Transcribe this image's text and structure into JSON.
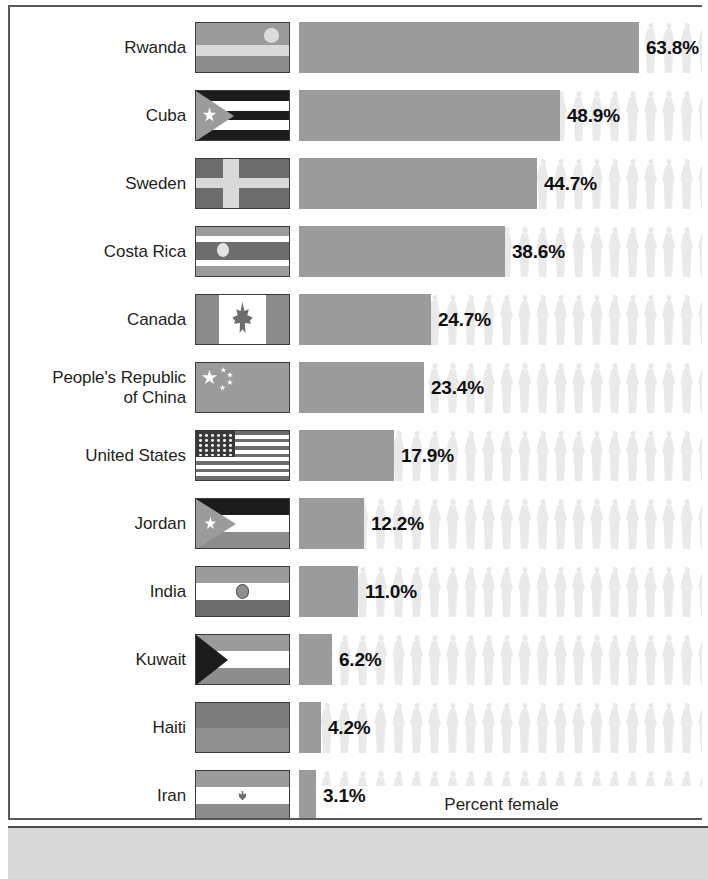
{
  "chart_data": {
    "type": "bar",
    "title": "",
    "xlabel": "Percent female",
    "ylabel": "",
    "orientation": "horizontal",
    "grid": false,
    "legend": null,
    "xlim": [
      0,
      76
    ],
    "unit": "%",
    "categories": [
      "Rwanda",
      "Cuba",
      "Sweden",
      "Costa Rica",
      "Canada",
      "People's Republic of China",
      "United States",
      "Jordan",
      "India",
      "Kuwait",
      "Haiti",
      "Iran"
    ],
    "values": [
      63.8,
      48.9,
      44.7,
      38.6,
      24.7,
      23.4,
      17.9,
      12.2,
      11.0,
      6.2,
      4.2,
      3.1
    ],
    "value_labels": [
      "63.8%",
      "48.9%",
      "44.7%",
      "38.6%",
      "24.7%",
      "23.4%",
      "17.9%",
      "12.2%",
      "11.0%",
      "6.2%",
      "4.2%",
      "3.1%"
    ]
  },
  "axis": {
    "x_title": "Percent female"
  },
  "rows": [
    {
      "country": "Rwanda",
      "country_line1": "Rwanda",
      "country_line2": "",
      "value": 63.8,
      "value_label": "63.8%",
      "flag_name": "flag-rwanda"
    },
    {
      "country": "Cuba",
      "country_line1": "Cuba",
      "country_line2": "",
      "value": 48.9,
      "value_label": "48.9%",
      "flag_name": "flag-cuba"
    },
    {
      "country": "Sweden",
      "country_line1": "Sweden",
      "country_line2": "",
      "value": 44.7,
      "value_label": "44.7%",
      "flag_name": "flag-sweden"
    },
    {
      "country": "Costa Rica",
      "country_line1": "Costa Rica",
      "country_line2": "",
      "value": 38.6,
      "value_label": "38.6%",
      "flag_name": "flag-costa-rica"
    },
    {
      "country": "Canada",
      "country_line1": "Canada",
      "country_line2": "",
      "value": 24.7,
      "value_label": "24.7%",
      "flag_name": "flag-canada"
    },
    {
      "country": "People's Republic of China",
      "country_line1": "People's Republic",
      "country_line2": "of China",
      "value": 23.4,
      "value_label": "23.4%",
      "flag_name": "flag-china"
    },
    {
      "country": "United States",
      "country_line1": "United States",
      "country_line2": "",
      "value": 17.9,
      "value_label": "17.9%",
      "flag_name": "flag-united-states"
    },
    {
      "country": "Jordan",
      "country_line1": "Jordan",
      "country_line2": "",
      "value": 12.2,
      "value_label": "12.2%",
      "flag_name": "flag-jordan"
    },
    {
      "country": "India",
      "country_line1": "India",
      "country_line2": "",
      "value": 11.0,
      "value_label": "11.0%",
      "flag_name": "flag-india"
    },
    {
      "country": "Kuwait",
      "country_line1": "Kuwait",
      "country_line2": "",
      "value": 6.2,
      "value_label": "6.2%",
      "flag_name": "flag-kuwait"
    },
    {
      "country": "Haiti",
      "country_line1": "Haiti",
      "country_line2": "",
      "value": 4.2,
      "value_label": "4.2%",
      "flag_name": "flag-haiti"
    },
    {
      "country": "Iran",
      "country_line1": "Iran",
      "country_line2": "",
      "value": 3.1,
      "value_label": "3.1%",
      "flag_name": "flag-iran"
    }
  ],
  "colors": {
    "bar": "#9b9b9b",
    "background_figure": "#e9e9e9",
    "text": "#231f20",
    "value_text": "#101010",
    "frame": "#58585a",
    "bottom_strip": "#d8d8d8"
  }
}
